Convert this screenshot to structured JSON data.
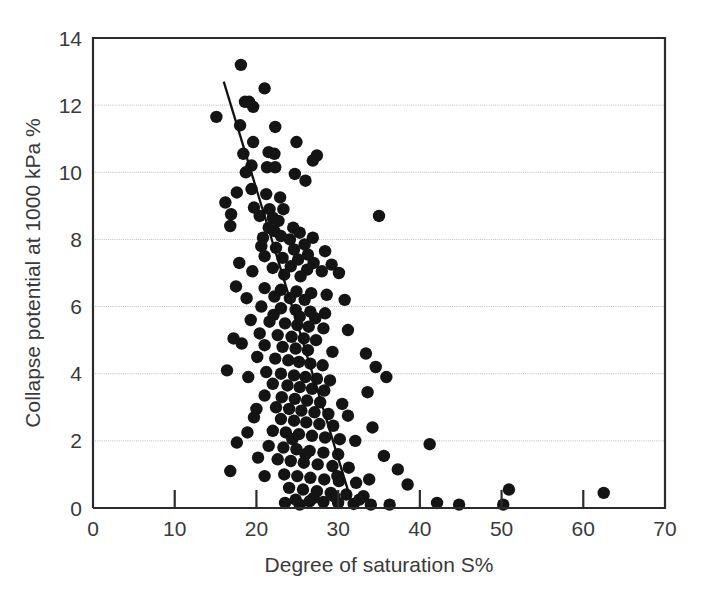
{
  "chart_data": {
    "type": "scatter",
    "title": "",
    "xlabel": "Degree of saturation S%",
    "ylabel": "Collapse potential at 1000 kPa %",
    "xlim": [
      0,
      70
    ],
    "ylim": [
      0,
      14
    ],
    "xticks": [
      0,
      10,
      20,
      30,
      40,
      50,
      60,
      70
    ],
    "yticks": [
      0,
      2,
      4,
      6,
      8,
      10,
      12,
      14
    ],
    "xtick_labels": [
      "0",
      "10",
      "20",
      "30",
      "40",
      "50",
      "60",
      "70"
    ],
    "ytick_labels": [
      "0",
      "2",
      "4",
      "6",
      "8",
      "10",
      "12",
      "14"
    ],
    "grid": "horizontal-dotted",
    "legend": "none",
    "marker": "filled-circle",
    "marker_color": "#141414",
    "marker_size": 6.2,
    "trendline": {
      "type": "linear-fit",
      "color": "#111111",
      "x_start": 16.0,
      "y_start": 12.7,
      "x_end": 31.8,
      "y_end": 0.05
    },
    "points": [
      [
        18.1,
        13.2
      ],
      [
        21.0,
        12.5
      ],
      [
        18.6,
        12.1
      ],
      [
        19.1,
        12.1
      ],
      [
        19.6,
        11.95
      ],
      [
        15.1,
        11.65
      ],
      [
        18.0,
        11.4
      ],
      [
        22.3,
        11.35
      ],
      [
        19.6,
        10.9
      ],
      [
        24.9,
        10.9
      ],
      [
        18.4,
        10.55
      ],
      [
        21.5,
        10.6
      ],
      [
        22.2,
        10.55
      ],
      [
        27.4,
        10.5
      ],
      [
        26.9,
        10.35
      ],
      [
        19.4,
        10.2
      ],
      [
        21.3,
        10.15
      ],
      [
        22.3,
        10.15
      ],
      [
        18.7,
        10.0
      ],
      [
        24.7,
        9.95
      ],
      [
        26.0,
        9.75
      ],
      [
        19.4,
        9.5
      ],
      [
        21.2,
        9.35
      ],
      [
        22.9,
        9.25
      ],
      [
        19.7,
        8.95
      ],
      [
        21.6,
        8.9
      ],
      [
        23.3,
        8.9
      ],
      [
        16.9,
        8.75
      ],
      [
        20.4,
        8.7
      ],
      [
        22.0,
        8.65
      ],
      [
        22.7,
        8.55
      ],
      [
        35.0,
        8.7
      ],
      [
        16.8,
        8.4
      ],
      [
        21.5,
        8.35
      ],
      [
        24.5,
        8.35
      ],
      [
        22.2,
        8.25
      ],
      [
        25.3,
        8.2
      ],
      [
        23.0,
        8.1
      ],
      [
        26.9,
        8.05
      ],
      [
        24.1,
        8.0
      ],
      [
        25.9,
        7.85
      ],
      [
        20.6,
        7.8
      ],
      [
        22.4,
        7.75
      ],
      [
        24.6,
        7.7
      ],
      [
        28.4,
        7.65
      ],
      [
        26.3,
        7.55
      ],
      [
        21.0,
        7.5
      ],
      [
        23.2,
        7.45
      ],
      [
        25.1,
        7.4
      ],
      [
        27.0,
        7.3
      ],
      [
        29.2,
        7.25
      ],
      [
        24.2,
        7.2
      ],
      [
        22.0,
        7.15
      ],
      [
        26.2,
        7.1
      ],
      [
        28.0,
        7.05
      ],
      [
        30.1,
        7.0
      ],
      [
        23.4,
        6.95
      ],
      [
        25.4,
        6.9
      ],
      [
        17.5,
        6.6
      ],
      [
        21.0,
        6.55
      ],
      [
        23.0,
        6.5
      ],
      [
        24.9,
        6.45
      ],
      [
        26.7,
        6.4
      ],
      [
        28.6,
        6.35
      ],
      [
        22.2,
        6.3
      ],
      [
        24.1,
        6.25
      ],
      [
        25.9,
        6.2
      ],
      [
        30.8,
        6.2
      ],
      [
        20.6,
        6.0
      ],
      [
        23.0,
        5.95
      ],
      [
        24.8,
        5.9
      ],
      [
        26.6,
        5.85
      ],
      [
        28.4,
        5.8
      ],
      [
        22.1,
        5.75
      ],
      [
        25.3,
        5.7
      ],
      [
        27.2,
        5.65
      ],
      [
        19.3,
        5.6
      ],
      [
        21.6,
        5.55
      ],
      [
        23.5,
        5.5
      ],
      [
        25.0,
        5.45
      ],
      [
        26.4,
        5.4
      ],
      [
        28.2,
        5.35
      ],
      [
        31.2,
        5.3
      ],
      [
        20.4,
        5.2
      ],
      [
        22.6,
        5.15
      ],
      [
        24.3,
        5.1
      ],
      [
        25.8,
        5.05
      ],
      [
        27.3,
        5.0
      ],
      [
        18.2,
        4.9
      ],
      [
        21.0,
        4.85
      ],
      [
        23.2,
        4.8
      ],
      [
        24.8,
        4.75
      ],
      [
        26.3,
        4.7
      ],
      [
        29.3,
        4.65
      ],
      [
        33.4,
        4.6
      ],
      [
        20.1,
        4.5
      ],
      [
        22.3,
        4.45
      ],
      [
        23.9,
        4.4
      ],
      [
        25.2,
        4.35
      ],
      [
        26.6,
        4.3
      ],
      [
        28.1,
        4.25
      ],
      [
        34.6,
        4.2
      ],
      [
        16.4,
        4.1
      ],
      [
        21.2,
        4.05
      ],
      [
        23.0,
        4.0
      ],
      [
        24.6,
        3.95
      ],
      [
        26.0,
        3.9
      ],
      [
        27.4,
        3.85
      ],
      [
        29.0,
        3.8
      ],
      [
        35.9,
        3.9
      ],
      [
        22.0,
        3.7
      ],
      [
        23.8,
        3.65
      ],
      [
        25.3,
        3.6
      ],
      [
        26.8,
        3.55
      ],
      [
        28.3,
        3.5
      ],
      [
        33.6,
        3.45
      ],
      [
        21.0,
        3.35
      ],
      [
        23.1,
        3.3
      ],
      [
        24.7,
        3.25
      ],
      [
        26.2,
        3.2
      ],
      [
        27.8,
        3.15
      ],
      [
        30.5,
        3.1
      ],
      [
        22.4,
        3.0
      ],
      [
        24.0,
        2.95
      ],
      [
        25.5,
        2.9
      ],
      [
        27.1,
        2.85
      ],
      [
        28.8,
        2.8
      ],
      [
        31.2,
        2.75
      ],
      [
        19.7,
        2.7
      ],
      [
        23.0,
        2.65
      ],
      [
        24.6,
        2.6
      ],
      [
        26.1,
        2.55
      ],
      [
        27.7,
        2.5
      ],
      [
        29.4,
        2.45
      ],
      [
        34.2,
        2.4
      ],
      [
        22.0,
        2.3
      ],
      [
        23.6,
        2.25
      ],
      [
        25.2,
        2.2
      ],
      [
        26.8,
        2.15
      ],
      [
        28.4,
        2.1
      ],
      [
        30.2,
        2.05
      ],
      [
        32.1,
        2.0
      ],
      [
        41.2,
        1.9
      ],
      [
        17.6,
        1.95
      ],
      [
        21.5,
        1.85
      ],
      [
        23.3,
        1.8
      ],
      [
        24.9,
        1.75
      ],
      [
        26.5,
        1.7
      ],
      [
        28.2,
        1.65
      ],
      [
        30.0,
        1.6
      ],
      [
        35.6,
        1.55
      ],
      [
        16.8,
        1.1
      ],
      [
        22.6,
        1.45
      ],
      [
        24.2,
        1.4
      ],
      [
        25.8,
        1.35
      ],
      [
        27.5,
        1.3
      ],
      [
        29.3,
        1.25
      ],
      [
        31.3,
        1.2
      ],
      [
        37.3,
        1.15
      ],
      [
        23.4,
        1.0
      ],
      [
        25.0,
        0.95
      ],
      [
        26.6,
        0.9
      ],
      [
        28.3,
        0.85
      ],
      [
        30.1,
        0.8
      ],
      [
        32.2,
        0.75
      ],
      [
        38.5,
        0.7
      ],
      [
        24.0,
        0.6
      ],
      [
        25.7,
        0.55
      ],
      [
        27.4,
        0.5
      ],
      [
        29.1,
        0.45
      ],
      [
        31.0,
        0.4
      ],
      [
        33.1,
        0.35
      ],
      [
        50.9,
        0.55
      ],
      [
        62.5,
        0.45
      ],
      [
        24.8,
        0.25
      ],
      [
        26.5,
        0.2
      ],
      [
        28.2,
        0.18
      ],
      [
        30.0,
        0.15
      ],
      [
        31.9,
        0.12
      ],
      [
        34.0,
        0.1
      ],
      [
        36.3,
        0.1
      ],
      [
        42.1,
        0.15
      ],
      [
        44.8,
        0.1
      ],
      [
        50.2,
        0.1
      ],
      [
        23.5,
        0.15
      ],
      [
        25.3,
        0.1
      ],
      [
        27.0,
        0.3
      ],
      [
        29.5,
        0.35
      ],
      [
        32.6,
        0.25
      ],
      [
        18.9,
        2.25
      ],
      [
        20.2,
        1.5
      ],
      [
        21.0,
        0.95
      ],
      [
        24.4,
        2.05
      ],
      [
        26.0,
        1.6
      ],
      [
        29.9,
        0.95
      ],
      [
        33.8,
        0.85
      ],
      [
        19.0,
        3.9
      ],
      [
        20.0,
        2.95
      ],
      [
        17.2,
        5.05
      ],
      [
        18.8,
        6.25
      ],
      [
        20.8,
        8.05
      ],
      [
        17.9,
        7.3
      ],
      [
        19.5,
        7.05
      ],
      [
        16.2,
        9.1
      ],
      [
        17.6,
        9.4
      ]
    ]
  }
}
